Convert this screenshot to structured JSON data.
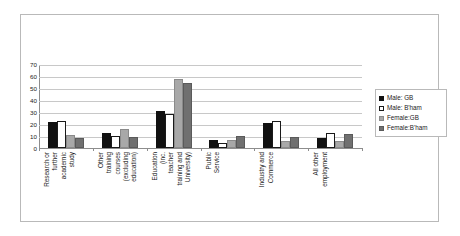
{
  "chart_data": {
    "type": "bar",
    "title": "",
    "xlabel": "",
    "ylabel": "",
    "ylim": [
      0,
      70
    ],
    "yticks": [
      0,
      10,
      20,
      30,
      40,
      50,
      60,
      70
    ],
    "grid": true,
    "legend_position": "right",
    "categories": [
      [
        "Research or",
        "further",
        "academic",
        "study"
      ],
      [
        "Other",
        "training",
        "courses",
        "(excluding",
        "education)"
      ],
      [
        "Education",
        "(inc.",
        "teacher",
        "training and",
        "University)"
      ],
      [
        "Public",
        "Service"
      ],
      [
        "Industry and",
        "Commerce"
      ],
      [
        "All other",
        "employment"
      ]
    ],
    "category_labels": [
      "Research or further academic study",
      "Other training courses (excluding education)",
      "Education (inc. teacher training and University)",
      "Public Service",
      "Industry and Commerce",
      "All other employment"
    ],
    "series": [
      {
        "name": "Male: GB",
        "color": "#111111",
        "values": [
          22,
          12.5,
          31,
          7,
          21,
          8.5
        ]
      },
      {
        "name": "Male: B'ham",
        "color": "#ffffff",
        "values": [
          22.5,
          10.5,
          29,
          4,
          22.5,
          13
        ]
      },
      {
        "name": "Female:GB",
        "color": "#a8a8a8",
        "values": [
          11,
          16,
          58,
          6.5,
          5.5,
          6
        ]
      },
      {
        "name": "Female:B'ham",
        "color": "#707070",
        "values": [
          8.5,
          9.5,
          55,
          10.5,
          9,
          11.5
        ]
      }
    ]
  },
  "legend": {
    "entries": [
      "Male: GB",
      "Male: B'ham",
      "Female:GB",
      "Female:B'ham"
    ]
  },
  "axis": {
    "y_tick_labels": [
      "70",
      "60",
      "50",
      "40",
      "30",
      "20",
      "10",
      "0"
    ]
  }
}
